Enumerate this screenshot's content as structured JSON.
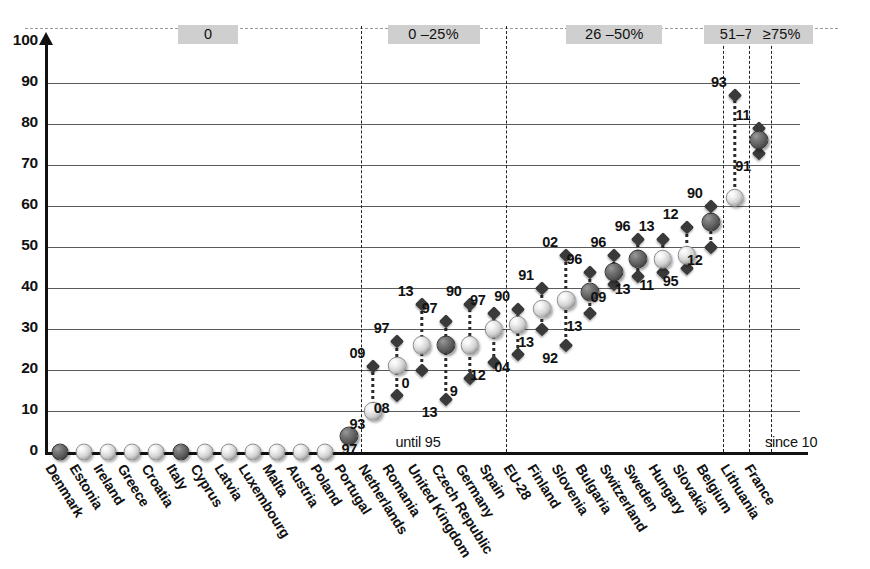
{
  "chart_data": {
    "type": "scatter",
    "title": "",
    "xlabel": "",
    "ylabel": "",
    "ylim": [
      0,
      100
    ],
    "yticks": [
      0,
      10,
      20,
      30,
      40,
      50,
      60,
      70,
      80,
      90,
      100
    ],
    "grid": true,
    "legend_position": "none",
    "band_headers": [
      {
        "label": "0",
        "start_index": 0,
        "end_index": 14
      },
      {
        "label": "0 –25%",
        "start_index": 15,
        "end_index": 21
      },
      {
        "label": "26 –50%",
        "start_index": 22,
        "end_index": 30
      },
      {
        "label": "51–75%",
        "start_index": 31,
        "end_index": 32
      },
      {
        "label": "≥75%",
        "start_index": 33,
        "end_index": 33
      }
    ],
    "annotations": [
      {
        "text": "until 95",
        "near": "Romania"
      },
      {
        "text": "since 10",
        "near": "France"
      }
    ],
    "categories": [
      "Denmark",
      "Estonia",
      "Ireland",
      "Greece",
      "Croatia",
      "Italy",
      "Cyprus",
      "Latvia",
      "Luxembourg",
      "Malta",
      "Austria",
      "Poland",
      "Portugal",
      "Netherlands",
      "Romania",
      "United Kingdom",
      "Czech Republic",
      "Germany",
      "Spain",
      "EU-28",
      "Finland",
      "Slovenia",
      "Bulgaria",
      "Switzerland",
      "Sweden",
      "Hungary",
      "Slovakia",
      "Belgium",
      "Lithuania",
      "France"
    ],
    "points": [
      {
        "country": "Denmark",
        "value": 0,
        "fill": "dark",
        "high": null,
        "low": null,
        "high_label": "",
        "low_label": ""
      },
      {
        "country": "Estonia",
        "value": 0,
        "fill": "light",
        "high": null,
        "low": null,
        "high_label": "",
        "low_label": ""
      },
      {
        "country": "Ireland",
        "value": 0,
        "fill": "light",
        "high": null,
        "low": null,
        "high_label": "",
        "low_label": ""
      },
      {
        "country": "Greece",
        "value": 0,
        "fill": "light",
        "high": null,
        "low": null,
        "high_label": "",
        "low_label": ""
      },
      {
        "country": "Croatia",
        "value": 0,
        "fill": "light",
        "high": null,
        "low": null,
        "high_label": "",
        "low_label": ""
      },
      {
        "country": "Italy",
        "value": 0,
        "fill": "dark",
        "high": null,
        "low": null,
        "high_label": "",
        "low_label": ""
      },
      {
        "country": "Cyprus",
        "value": 0,
        "fill": "light",
        "high": null,
        "low": null,
        "high_label": "",
        "low_label": ""
      },
      {
        "country": "Latvia",
        "value": 0,
        "fill": "light",
        "high": null,
        "low": null,
        "high_label": "",
        "low_label": ""
      },
      {
        "country": "Luxembourg",
        "value": 0,
        "fill": "light",
        "high": null,
        "low": null,
        "high_label": "",
        "low_label": ""
      },
      {
        "country": "Malta",
        "value": 0,
        "fill": "light",
        "high": null,
        "low": null,
        "high_label": "",
        "low_label": ""
      },
      {
        "country": "Austria",
        "value": 0,
        "fill": "light",
        "high": null,
        "low": null,
        "high_label": "",
        "low_label": ""
      },
      {
        "country": "Poland",
        "value": 0,
        "fill": "light",
        "high": null,
        "low": null,
        "high_label": "",
        "low_label": ""
      },
      {
        "country": "Portugal",
        "value": 4,
        "fill": "dark",
        "high": null,
        "low": null,
        "high_label": "",
        "low_label": "97"
      },
      {
        "country": "Netherlands",
        "value": 10,
        "fill": "light",
        "high": 21,
        "low": null,
        "high_label": "09",
        "low_label": "93"
      },
      {
        "country": "Romania",
        "value": 21,
        "fill": "light",
        "high": 27,
        "low": 14,
        "high_label": "97",
        "low_label": "08"
      },
      {
        "country": "United Kingdom",
        "value": 26,
        "fill": "light",
        "high": 36,
        "low": 20,
        "high_label": "13",
        "low_label": "0"
      },
      {
        "country": "Czech Republic",
        "value": 26,
        "fill": "dark",
        "high": 32,
        "low": 13,
        "high_label": "97",
        "low_label": "13"
      },
      {
        "country": "Germany",
        "value": 26,
        "fill": "light",
        "high": 36,
        "low": 18,
        "high_label": "90",
        "low_label": "9"
      },
      {
        "country": "Spain",
        "value": 30,
        "fill": "light",
        "high": 34,
        "low": 22,
        "high_label": "97",
        "low_label": "12"
      },
      {
        "country": "EU-28",
        "value": 31,
        "fill": "light",
        "high": 35,
        "low": 24,
        "high_label": "90",
        "low_label": "04"
      },
      {
        "country": "Finland",
        "value": 35,
        "fill": "light",
        "high": 40,
        "low": 30,
        "high_label": "91",
        "low_label": "13"
      },
      {
        "country": "Slovenia",
        "value": 37,
        "fill": "light",
        "high": 48,
        "low": 26,
        "high_label": "02",
        "low_label": "92"
      },
      {
        "country": "Bulgaria",
        "value": 39,
        "fill": "dark",
        "high": 44,
        "low": 34,
        "high_label": "96",
        "low_label": "13"
      },
      {
        "country": "Switzerland",
        "value": 44,
        "fill": "dark",
        "high": 48,
        "low": 41,
        "high_label": "96",
        "low_label": "09"
      },
      {
        "country": "Sweden",
        "value": 47,
        "fill": "dark",
        "high": 52,
        "low": 43,
        "high_label": "96",
        "low_label": "13"
      },
      {
        "country": "Hungary",
        "value": 47,
        "fill": "light",
        "high": 52,
        "low": 44,
        "high_label": "13",
        "low_label": "11"
      },
      {
        "country": "Slovakia",
        "value": 48,
        "fill": "light",
        "high": 55,
        "low": 45,
        "high_label": "12",
        "low_label": "95"
      },
      {
        "country": "Belgium",
        "value": 56,
        "fill": "dark",
        "high": 60,
        "low": 50,
        "high_label": "90",
        "low_label": "12"
      },
      {
        "country": "Lithuania",
        "value": 62,
        "fill": "light",
        "high": 87,
        "low": null,
        "high_label": "93",
        "low_label": ""
      },
      {
        "country": "France",
        "value": 76,
        "fill": "dark",
        "high": 79,
        "low": 73,
        "high_label": "11",
        "low_label": "91"
      }
    ]
  },
  "colors": {
    "band_background": "#cfcfcf",
    "gridline": "#5a5a5a",
    "axis": "#111111",
    "marker_dark": "#4a4a4a",
    "marker_light": "#e8e8e8",
    "diamond": "#3a3a3a"
  }
}
